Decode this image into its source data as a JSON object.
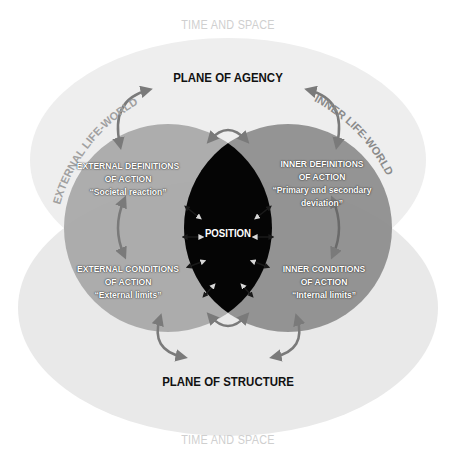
{
  "labels": {
    "time_and_space_top": "TIME AND SPACE",
    "time_and_space_bottom": "TIME AND SPACE",
    "plane_of_agency": "PLANE OF AGENCY",
    "plane_of_structure": "PLANE OF STRUCTURE",
    "external_life_world": "EXTERNAL LIFE-WORLD",
    "inner_life_world": "INNER LIFE-WORLD",
    "position": "POSITION"
  },
  "quadrants": {
    "external_definitions": {
      "line1": "EXTERNAL DEFINITIONS",
      "line2": "OF ACTION",
      "line3": "“Societal reaction”"
    },
    "inner_definitions": {
      "line1": "INNER DEFINITIONS",
      "line2": "OF ACTION",
      "line3": "“Primary and secondary",
      "line4": "deviation”"
    },
    "external_conditions": {
      "line1": "EXTERNAL CONDITIONS",
      "line2": "OF ACTION",
      "line3": "“External limits”"
    },
    "inner_conditions": {
      "line1": "INNER CONDITIONS",
      "line2": "OF ACTION",
      "line3": "“Internal limits”"
    }
  },
  "colors": {
    "outer_ellipse": "#ececec",
    "outer_overlap": "#dedede",
    "left_circle": "#a8a8a8",
    "right_circle": "#8f8f8f",
    "position_core": "#050505",
    "arrow": "#7a7a7a",
    "time_space_text": "#cfcfcf",
    "plane_text": "#111111"
  }
}
